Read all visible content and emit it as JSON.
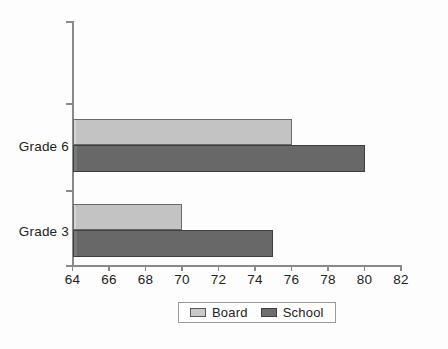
{
  "chart_data": {
    "type": "bar",
    "orientation": "horizontal",
    "title": "",
    "xlabel": "",
    "ylabel": "",
    "categories": [
      "Grade 3",
      "Grade 6"
    ],
    "series": [
      {
        "name": "Board",
        "values": [
          70,
          76
        ],
        "color": "#c9c9c9"
      },
      {
        "name": "School",
        "values": [
          75,
          80
        ],
        "color": "#6e6e6e"
      }
    ],
    "xlim": [
      64,
      82
    ],
    "xticks": [
      64,
      66,
      68,
      70,
      72,
      74,
      76,
      78,
      80,
      82
    ],
    "xtick_labels": [
      "64",
      "66",
      "68",
      "70",
      "72",
      "74",
      "76",
      "78",
      "80",
      "82"
    ],
    "grid": false,
    "legend_position": "bottom"
  },
  "axis": {
    "ticks": [
      {
        "label": "64",
        "value": 64
      },
      {
        "label": "66",
        "value": 66
      },
      {
        "label": "68",
        "value": 68
      },
      {
        "label": "70",
        "value": 70
      },
      {
        "label": "72",
        "value": 72
      },
      {
        "label": "74",
        "value": 74
      },
      {
        "label": "76",
        "value": 76
      },
      {
        "label": "78",
        "value": 78
      },
      {
        "label": "80",
        "value": 80
      },
      {
        "label": "82",
        "value": 82
      }
    ]
  },
  "categories": [
    {
      "label": "Grade 6"
    },
    {
      "label": "Grade 3"
    }
  ],
  "legend": {
    "items": [
      {
        "label": "Board",
        "color": "#c9c9c9"
      },
      {
        "label": "School",
        "color": "#6e6e6e"
      }
    ]
  }
}
